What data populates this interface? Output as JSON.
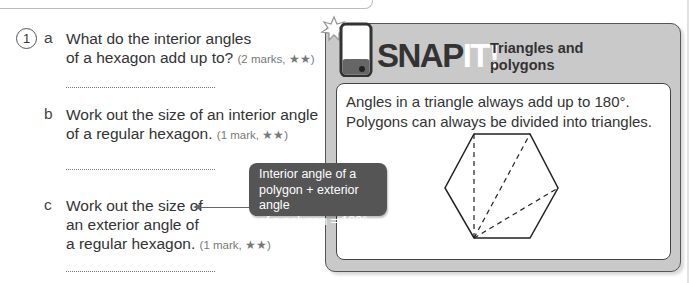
{
  "question": {
    "number": "1",
    "parts": [
      {
        "letter": "a",
        "lines": [
          "What do the interior angles",
          "of a hexagon add up to?"
        ],
        "marks": "(2 marks, ★★)"
      },
      {
        "letter": "b",
        "lines": [
          "Work out the size of an interior angle",
          "of a regular hexagon."
        ],
        "marks": "(1 mark, ★★)"
      },
      {
        "letter": "c",
        "lines": [
          "Work out the size of",
          "an exterior angle of",
          "a regular hexagon."
        ],
        "marks": "(1 mark, ★★)"
      }
    ]
  },
  "callout": {
    "lines": [
      "Interior angle of a",
      "polygon + exterior angle",
      "of a polygon = 180°"
    ]
  },
  "snap_it": {
    "brand_snap": "SNAP",
    "brand_it": "IT!",
    "subtitle_lines": [
      "Triangles and",
      "polygons"
    ],
    "text_lines": [
      "Angles in a triangle always add up to 180°.",
      "Polygons can always be divided into triangles."
    ],
    "diagram": "regular hexagon divided into triangles from one vertex"
  },
  "colors": {
    "panel_gray": "#c9c9c9",
    "callout_bg": "#555555",
    "text": "#333333"
  }
}
